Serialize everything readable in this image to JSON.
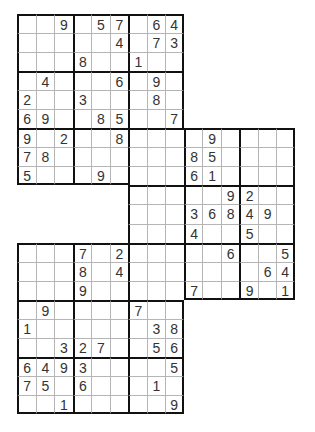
{
  "puzzle": {
    "type": "samurai-sudoku-3-grid",
    "rows": 21,
    "cols": 15,
    "colors": {
      "thick_line": "#111111",
      "thin_line": "#b5b5b5",
      "digit": "#333333",
      "background": "#ffffff"
    },
    "grid": [
      [
        "",
        "",
        "9",
        "",
        "5",
        "7",
        "",
        "6",
        "4",
        null,
        null,
        null,
        null,
        null,
        null
      ],
      [
        "",
        "",
        "",
        "",
        "",
        "4",
        "",
        "7",
        "3",
        null,
        null,
        null,
        null,
        null,
        null
      ],
      [
        "",
        "",
        "",
        "8",
        "",
        "",
        "1",
        "",
        "",
        null,
        null,
        null,
        null,
        null,
        null
      ],
      [
        "",
        "4",
        "",
        "",
        "",
        "6",
        "",
        "9",
        "",
        null,
        null,
        null,
        null,
        null,
        null
      ],
      [
        "2",
        "",
        "",
        "3",
        "",
        "",
        "",
        "8",
        "",
        null,
        null,
        null,
        null,
        null,
        null
      ],
      [
        "6",
        "9",
        "",
        "",
        "8",
        "5",
        "",
        "",
        "7",
        null,
        null,
        null,
        null,
        null,
        null
      ],
      [
        "9",
        "",
        "2",
        "",
        "",
        "8",
        "",
        "",
        "",
        "",
        "9",
        "",
        "",
        "",
        ""
      ],
      [
        "7",
        "8",
        "",
        "",
        "",
        "",
        "",
        "",
        "",
        "8",
        "5",
        "",
        "",
        "",
        ""
      ],
      [
        "5",
        "",
        "",
        "",
        "9",
        "",
        "",
        "",
        "",
        "6",
        "1",
        "",
        "",
        "",
        ""
      ],
      [
        null,
        null,
        null,
        null,
        null,
        null,
        "",
        "",
        "",
        "",
        "",
        "9",
        "2",
        "",
        ""
      ],
      [
        null,
        null,
        null,
        null,
        null,
        null,
        "",
        "",
        "",
        "3",
        "6",
        "8",
        "4",
        "9",
        ""
      ],
      [
        null,
        null,
        null,
        null,
        null,
        null,
        "",
        "",
        "",
        "4",
        "",
        "",
        "5",
        "",
        ""
      ],
      [
        "",
        "",
        "",
        "7",
        "",
        "2",
        "",
        "",
        "",
        "",
        "",
        "6",
        "",
        "",
        "5"
      ],
      [
        "",
        "",
        "",
        "8",
        "",
        "4",
        "",
        "",
        "",
        "",
        "",
        "",
        "",
        "6",
        "4"
      ],
      [
        "",
        "",
        "",
        "9",
        "",
        "",
        "",
        "",
        "",
        "7",
        "",
        "",
        "9",
        "",
        "1"
      ],
      [
        "",
        "9",
        "",
        "",
        "",
        "",
        "7",
        "",
        "",
        null,
        null,
        null,
        null,
        null,
        null
      ],
      [
        "1",
        "",
        "",
        "",
        "",
        "",
        "",
        "3",
        "8",
        null,
        null,
        null,
        null,
        null,
        null
      ],
      [
        "",
        "",
        "3",
        "2",
        "7",
        "",
        "",
        "5",
        "6",
        null,
        null,
        null,
        null,
        null,
        null
      ],
      [
        "6",
        "4",
        "9",
        "3",
        "",
        "",
        "",
        "",
        "5",
        null,
        null,
        null,
        null,
        null,
        null
      ],
      [
        "7",
        "5",
        "",
        "6",
        "",
        "",
        "",
        "1",
        "",
        null,
        null,
        null,
        null,
        null,
        null
      ],
      [
        "",
        "",
        "1",
        "",
        "",
        "",
        "",
        "",
        "9",
        null,
        null,
        null,
        null,
        null,
        null
      ]
    ]
  }
}
